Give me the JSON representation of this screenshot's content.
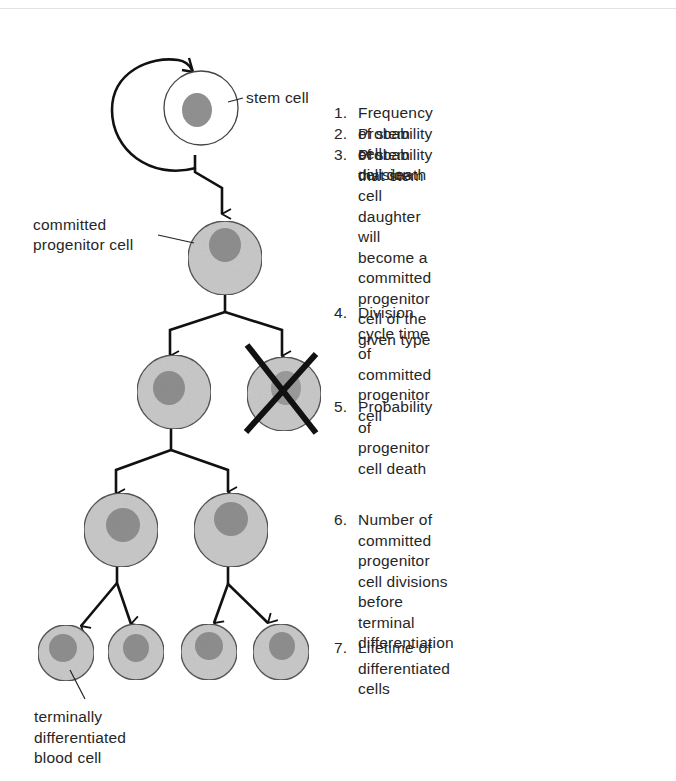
{
  "labels": {
    "stem_cell": "stem cell",
    "committed_progenitor": "committed\nprogenitor cell",
    "terminal_cell": "terminally\ndifferentiated\nblood cell"
  },
  "steps": [
    {
      "num": "1.",
      "text": "Frequency of stem cell division"
    },
    {
      "num": "2.",
      "text": "Probability of stem cell death"
    },
    {
      "num": "3.",
      "text": "Probability that stem cell daughter\nwill become a committed progenitor\ncell of the given type"
    },
    {
      "num": "4.",
      "text": "Division cycle time of committed\nprogenitor cell"
    },
    {
      "num": "5.",
      "text": "Probability of progenitor cell death"
    },
    {
      "num": "6.",
      "text": "Number of committed progenitor\ncell divisions before terminal\ndifferentiation"
    },
    {
      "num": "7.",
      "text": "Lifetime of differentiated cells"
    }
  ],
  "colors": {
    "cell_fill": "#c9c9c9",
    "nucleus_fill": "#8f8f8f",
    "stem_fill": "#ffffff",
    "line": "#111111"
  }
}
